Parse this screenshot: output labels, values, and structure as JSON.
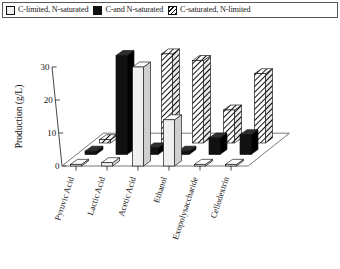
{
  "legend": {
    "entries": [
      {
        "label": "C-limited, N-saturated",
        "style": "white"
      },
      {
        "label": "C-and N-saturated",
        "style": "black"
      },
      {
        "label": "C-saturated, N-limited",
        "style": "hatch"
      }
    ]
  },
  "chart_data": {
    "type": "bar",
    "subtype": "grouped-3d",
    "title": "",
    "xlabel": "",
    "ylabel": "Production (g/L)",
    "ylim": [
      0,
      30
    ],
    "yticks": [
      0,
      10,
      20,
      30
    ],
    "ytick_labels": [
      "0",
      "10",
      "20",
      "30"
    ],
    "grid": false,
    "legend_position": "top",
    "categories": [
      "Pyruvic Acid",
      "Lactic Acid",
      "Acetic Acid",
      "Ethanol",
      "Exopolysaccharide",
      "Cellodextrin"
    ],
    "series": [
      {
        "name": "C-limited, N-saturated",
        "style": "white",
        "values": [
          0.5,
          1.0,
          30.0,
          14.0,
          0.5,
          0.5
        ]
      },
      {
        "name": "C-and N-saturated",
        "style": "black",
        "values": [
          1.0,
          30.0,
          2.0,
          1.0,
          5.0,
          6.0
        ]
      },
      {
        "name": "C-saturated, N-limited",
        "style": "hatch",
        "values": [
          1.0,
          6.0,
          27.0,
          25.0,
          10.0,
          21.0
        ]
      }
    ]
  },
  "colors": {
    "white_series": "#f0f0f0",
    "black_series": "#111111",
    "hatch_series": "#ffffff",
    "axis": "#333333",
    "text": "#111111"
  }
}
